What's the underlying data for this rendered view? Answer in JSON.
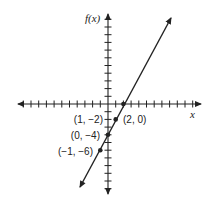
{
  "chart_data": {
    "type": "line",
    "title": "",
    "xlabel": "x",
    "ylabel": "f(x)",
    "xlim": [
      -11,
      11
    ],
    "ylim": [
      -11,
      11
    ],
    "grid": false,
    "legend": null,
    "series": [
      {
        "name": "f(x) = 2x - 4",
        "x": [
          -3.6,
          7.6
        ],
        "y": [
          -11.2,
          11.2
        ]
      }
    ],
    "points": [
      {
        "x": 2,
        "y": 0,
        "label": "(2, 0)"
      },
      {
        "x": 1,
        "y": -2,
        "label": "(1, −2)"
      },
      {
        "x": 0,
        "y": -4,
        "label": "(0, −4)"
      },
      {
        "x": -1,
        "y": -6,
        "label": "(−1, −6)"
      }
    ],
    "annotations": [
      "(2, 0)",
      "(1, −2)",
      "(0, −4)",
      "(−1, −6)"
    ]
  },
  "labels": {
    "x_axis": "x",
    "y_axis": "f(x)",
    "p_2_0": "(2, 0)",
    "p_1_m2": "(1, −2)",
    "p_0_m4": "(0, −4)",
    "p_m1_m6": "(−1, −6)"
  },
  "colors": {
    "ink": "#222222"
  }
}
